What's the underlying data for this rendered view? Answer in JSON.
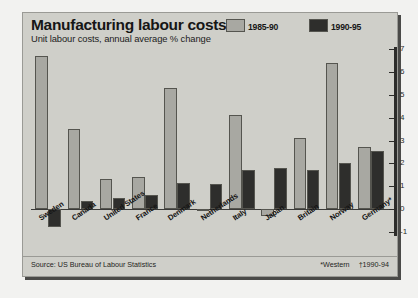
{
  "header": {
    "title": "Manufacturing labour costs",
    "subtitle": "Unit labour costs, annual average % change"
  },
  "legend": [
    {
      "label": "1985-90",
      "color": "#a8a8a2"
    },
    {
      "label": "1990-95",
      "color": "#2e2e2c"
    }
  ],
  "footer": {
    "source": "Source: US Bureau of Labour Statistics",
    "note_western": "*Western",
    "note_years": "†1990-94"
  },
  "colors": {
    "panel": "#cfcfc9",
    "series_1985_90": "#a8a8a2",
    "series_1990_95": "#2e2e2c",
    "axis": "#2c2c2a",
    "text": "#161616"
  },
  "chart_data": {
    "type": "bar",
    "title": "Manufacturing labour costs",
    "subtitle": "Unit labour costs, annual average % change",
    "xlabel": "",
    "ylabel": "",
    "ylim": [
      -1,
      7
    ],
    "yticks": [
      7,
      6,
      5,
      4,
      3,
      2,
      1,
      0,
      -1
    ],
    "ytick_labels": [
      "7",
      "6",
      "5",
      "4",
      "3",
      "2",
      "1",
      "0",
      "-1"
    ],
    "axis_position": "right",
    "grid": false,
    "legend_position": "top-right",
    "categories": [
      "Sweden",
      "Canada",
      "United States",
      "France",
      "Denmark",
      "Netherlands",
      "Italy",
      "Japan",
      "Britain",
      "Norway",
      "Germany*"
    ],
    "series": [
      {
        "name": "1985-90",
        "color": "#a8a8a2",
        "values": [
          6.7,
          3.5,
          1.3,
          1.4,
          5.3,
          -0.1,
          4.1,
          -0.3,
          3.1,
          6.4,
          2.7
        ]
      },
      {
        "name": "1990-95",
        "color": "#2e2e2c",
        "values": [
          -0.8,
          0.35,
          0.5,
          0.6,
          1.15,
          1.1,
          1.7,
          1.8,
          1.7,
          2.0,
          2.55
        ]
      }
    ],
    "notes": [
      "*Western",
      "†1990-94"
    ],
    "source": "Source: US Bureau of Labour Statistics"
  }
}
